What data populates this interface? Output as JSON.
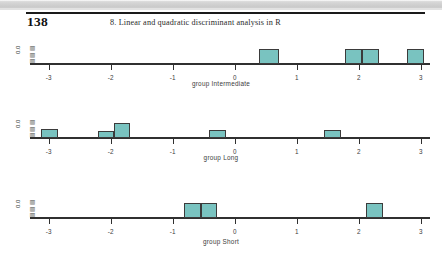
{
  "page": {
    "number": "138",
    "running_head": "8. Linear and quadratic discriminant analysis in R"
  },
  "colors": {
    "bar_fill": "#79c3c0",
    "bar_border": "#3b3b3b",
    "axis": "#303030",
    "text": "#3c3c3c"
  },
  "chart_data": [
    {
      "type": "bar",
      "title": "",
      "xlabel": "group Intermediate",
      "ylabel": "Density",
      "ytick_labels": [
        "0.0"
      ],
      "xlim": [
        -3.3,
        3.15
      ],
      "ylim": [
        0,
        1
      ],
      "grid": false,
      "legend": "none",
      "xticks": [
        -3,
        -2,
        -1,
        0,
        1,
        2,
        3
      ],
      "xtick_labels": [
        "-3",
        "-2",
        "-1",
        "0",
        "1",
        "2",
        "3"
      ],
      "bins": [
        {
          "x0": 0.4,
          "x1": 0.72,
          "height": 0.62
        },
        {
          "x0": 1.78,
          "x1": 2.05,
          "height": 0.62
        },
        {
          "x0": 2.05,
          "x1": 2.33,
          "height": 0.62
        },
        {
          "x0": 2.78,
          "x1": 3.05,
          "height": 0.62
        }
      ]
    },
    {
      "type": "bar",
      "title": "",
      "xlabel": "group Long",
      "ylabel": "Density",
      "ytick_labels": [
        "0.0"
      ],
      "xlim": [
        -3.3,
        3.15
      ],
      "ylim": [
        0,
        1
      ],
      "grid": false,
      "legend": "none",
      "xticks": [
        -3,
        -2,
        -1,
        0,
        1,
        2,
        3
      ],
      "xtick_labels": [
        "-3",
        "-2",
        "-1",
        "0",
        "1",
        "2",
        "3"
      ],
      "bins": [
        {
          "x0": -3.12,
          "x1": -2.85,
          "height": 0.38
        },
        {
          "x0": -2.2,
          "x1": -1.94,
          "height": 0.3
        },
        {
          "x0": -1.94,
          "x1": -1.68,
          "height": 0.62
        },
        {
          "x0": -0.42,
          "x1": -0.14,
          "height": 0.32
        },
        {
          "x0": 1.44,
          "x1": 1.72,
          "height": 0.32
        }
      ]
    },
    {
      "type": "bar",
      "title": "",
      "xlabel": "group Short",
      "ylabel": "Density",
      "ytick_labels": [
        "0.0"
      ],
      "xlim": [
        -3.3,
        3.15
      ],
      "ylim": [
        0,
        1
      ],
      "grid": false,
      "legend": "none",
      "xticks": [
        -3,
        -2,
        -1,
        0,
        1,
        2,
        3
      ],
      "xtick_labels": [
        "-3",
        "-2",
        "-1",
        "0",
        "1",
        "2",
        "3"
      ],
      "bins": [
        {
          "x0": -0.82,
          "x1": -0.55,
          "height": 0.62
        },
        {
          "x0": -0.55,
          "x1": -0.28,
          "height": 0.62
        },
        {
          "x0": 2.12,
          "x1": 2.4,
          "height": 0.62
        }
      ]
    }
  ]
}
